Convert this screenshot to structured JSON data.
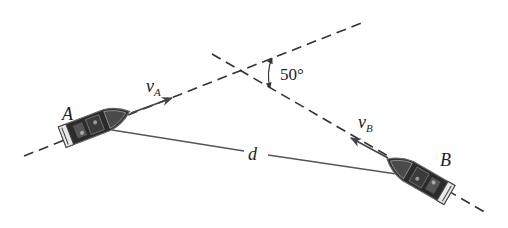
{
  "figure": {
    "labels": {
      "boat_a": "A",
      "boat_b": "B",
      "velocity_a_main": "v",
      "velocity_a_sub": "A",
      "velocity_b_main": "v",
      "velocity_b_sub": "B",
      "distance": "d",
      "angle": "50°"
    },
    "angle_deg": 50,
    "colors": {
      "line": "#333333",
      "boat_hull": "#2b2b2b",
      "boat_outline": "#555555",
      "background": "#ffffff"
    }
  }
}
